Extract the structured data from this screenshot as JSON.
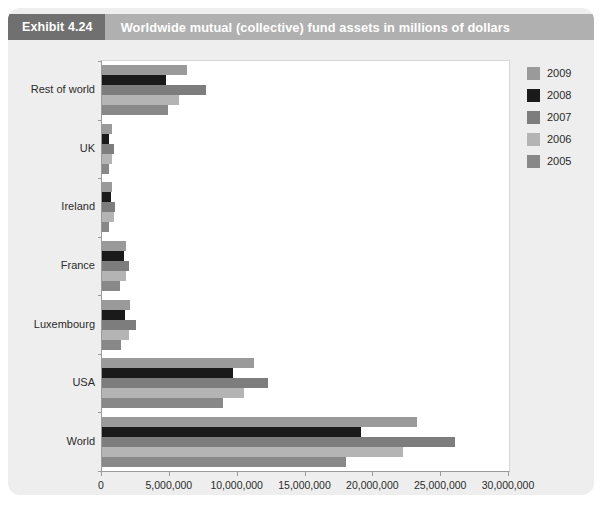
{
  "header": {
    "exhibit_number": "Exhibit 4.24",
    "title": "Worldwide mutual (collective) fund assets in millions of dollars",
    "chip_color": "#707070",
    "band_color": "#b0b0b0"
  },
  "card": {
    "background": "#eeeeee"
  },
  "legend": {
    "position": "right",
    "entries": [
      {
        "label": "2009",
        "color": "#9a9a9a"
      },
      {
        "label": "2008",
        "color": "#1a1a1a"
      },
      {
        "label": "2007",
        "color": "#7d7d7d"
      },
      {
        "label": "2006",
        "color": "#b4b4b4"
      },
      {
        "label": "2005",
        "color": "#888888"
      }
    ]
  },
  "chart_data": {
    "type": "bar",
    "orientation": "horizontal",
    "title": "Worldwide mutual (collective) fund assets in millions of dollars",
    "xlabel": "",
    "ylabel": "",
    "xlim": [
      0,
      30000000
    ],
    "grid": false,
    "legend_position": "right",
    "xticks": [
      0,
      5000000,
      10000000,
      15000000,
      20000000,
      25000000,
      30000000
    ],
    "xtick_labels": [
      "0",
      "5,000,000",
      "10,000,000",
      "15,000,000",
      "20,000,000",
      "25,000,000",
      "30,000,000"
    ],
    "categories": [
      "Rest of world",
      "UK",
      "Ireland",
      "France",
      "Luxembourg",
      "USA",
      "World"
    ],
    "series": [
      {
        "name": "2009",
        "color": "#9a9a9a",
        "values": [
          6300000,
          730000,
          750000,
          1800000,
          2060000,
          11200000,
          23200000
        ]
      },
      {
        "name": "2008",
        "color": "#1a1a1a",
        "values": [
          4700000,
          500000,
          700000,
          1600000,
          1700000,
          9660000,
          19100000
        ]
      },
      {
        "name": "2007",
        "color": "#7d7d7d",
        "values": [
          7700000,
          900000,
          950000,
          1990000,
          2500000,
          12200000,
          26000000
        ]
      },
      {
        "name": "2006",
        "color": "#b4b4b4",
        "values": [
          5700000,
          760000,
          850000,
          1770000,
          2000000,
          10500000,
          22200000
        ]
      },
      {
        "name": "2005",
        "color": "#888888",
        "values": [
          4900000,
          550000,
          550000,
          1360000,
          1400000,
          8900000,
          18000000
        ]
      }
    ]
  }
}
